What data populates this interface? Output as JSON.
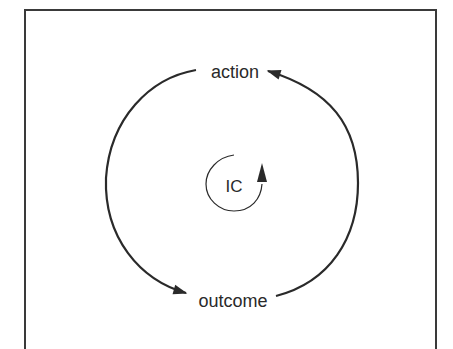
{
  "diagram": {
    "type": "causal-loop",
    "nodes": [
      {
        "id": "action",
        "label": "action"
      },
      {
        "id": "outcome",
        "label": "outcome"
      }
    ],
    "edges": [
      {
        "from": "action",
        "to": "outcome",
        "path": "left arc"
      },
      {
        "from": "outcome",
        "to": "action",
        "path": "right arc"
      }
    ],
    "loop_marker": {
      "label": "IC",
      "direction": "clockwise"
    },
    "colors": {
      "stroke": "#2a2a2a",
      "background": "#ffffff",
      "frame": "#3a3a3a"
    }
  }
}
